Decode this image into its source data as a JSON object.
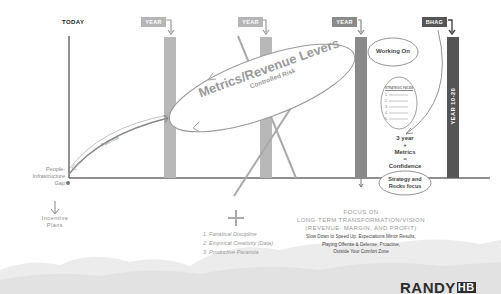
{
  "timeline": {
    "today_label": "TODAY",
    "markers": [
      {
        "label": "YEAR 1",
        "color": "#b5b5b5"
      },
      {
        "label": "YEAR 2",
        "color": "#b5b5b5"
      },
      {
        "label": "YEAR 3",
        "color": "#8a8a8a"
      },
      {
        "label": "BHAG",
        "color": "#555555"
      }
    ],
    "bhag_bar_label": "YEAR 10-20"
  },
  "left": {
    "gap_label_lines": [
      "People-",
      "Infrastructure",
      "Gap"
    ],
    "incentive_lines": [
      "Incentive",
      "Plans"
    ],
    "potential_label": "Potential"
  },
  "levers": {
    "title": "Metrics/Revenue Levers",
    "subtitle": "Controlled Risk"
  },
  "right_panel": {
    "working_on": "Working On",
    "strategic_header": "STRATEGIC FACES",
    "list_numbers": [
      "1.",
      "2.",
      "3.",
      "4.",
      "5."
    ],
    "confidence_lines": [
      "3 year",
      "+",
      "Metrics",
      "=",
      "Confidence"
    ],
    "strategy_lines": [
      "Strategy and",
      "Rocks focus"
    ]
  },
  "bottom_center": {
    "plus": "+",
    "items": [
      "1.  Fanatical Discipline",
      "2.  Empirical Creativity (Data)",
      "3.  Productive Paranoia"
    ]
  },
  "focus": {
    "arrow": "↓",
    "title_lines": [
      "FOCUS ON",
      "LONG-TERM TRANSFORMATION/VISION",
      "(REVENUE, MARGIN, AND PROFIT)"
    ],
    "sub_lines": [
      "Slow Down to Speed Up, Expectations Mirror Results,",
      "Playing Offense & Defense, Proactive,",
      "Outside Your Comfort Zone"
    ]
  },
  "brand": {
    "name": "RANDY",
    "mark": "HB"
  }
}
